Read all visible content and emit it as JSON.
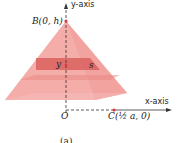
{
  "diagram": {
    "type": "pyramid-slice",
    "labels": {
      "y_axis": "y-axis",
      "x_axis": "x-axis",
      "apex": "B(0, h)",
      "origin": "O",
      "corner": "C(½ a, 0)",
      "slice_height": "y",
      "slice_side": "s",
      "caption": "(a)"
    },
    "colors": {
      "pyramid_light": "#f6b3b0",
      "pyramid_mid": "#ef8a86",
      "slice": "#d9625f",
      "point": "#e03a3a",
      "axis": "#333333"
    }
  }
}
